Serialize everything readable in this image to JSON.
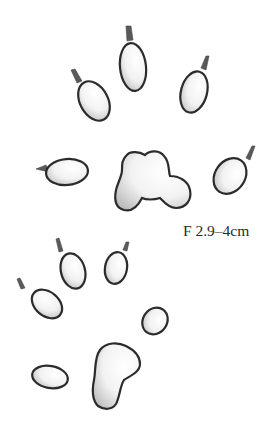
{
  "illustration": {
    "subject": "animal tracks",
    "front_track": {
      "label": "F 2.9–4cm",
      "toe_pads": 5,
      "claws_visible": 5
    },
    "hind_track": {
      "toe_pads": 4,
      "claws_visible": 3
    }
  },
  "colors": {
    "background": "#ffffff",
    "outline": "#2b2b2b",
    "shading": "#c8c8c8",
    "text": "#2a2a2a"
  }
}
